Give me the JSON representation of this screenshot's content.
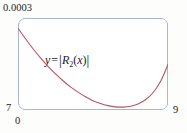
{
  "figure": {
    "background_color": "#fdfdfb",
    "frame_color": "#a9b6d4",
    "curve_color": "#b35663"
  },
  "axes": {
    "y_max_label": "0.0003",
    "y_min_label": "7",
    "x_min_label": "0",
    "x_max_label": "9"
  },
  "annotation": {
    "y_var": "y",
    "equals": "=",
    "bar_open": "|",
    "remainder_symbol": "R",
    "subscript": "2",
    "paren_open": "(",
    "argument": "x",
    "paren_close": ")",
    "bar_close": "|",
    "full_text": "y = |R2(x)|"
  },
  "chart_data": {
    "type": "line",
    "title": "",
    "xlabel": "",
    "ylabel": "",
    "xlim": [
      7,
      9
    ],
    "ylim": [
      0,
      0.0003
    ],
    "xtick_labels": [
      "7",
      "9"
    ],
    "ytick_labels": [
      "0",
      "0.0003"
    ],
    "grid": false,
    "legend": null,
    "annotations": [
      {
        "text": "y = |R2(x)|",
        "x": 7.35,
        "y": 0.000175
      }
    ],
    "series": [
      {
        "name": "|R2(x)|",
        "color": "#b35663",
        "x": [
          7.0,
          7.1,
          7.2,
          7.3,
          7.4,
          7.5,
          7.6,
          7.7,
          7.8,
          7.9,
          8.0,
          8.1,
          8.2,
          8.3,
          8.4,
          8.5,
          8.6,
          8.7,
          8.8,
          8.9,
          9.0
        ],
        "y": [
          0.000272,
          0.000236,
          0.000202,
          0.000171,
          0.000142,
          0.000116,
          9.3e-05,
          7.2e-05,
          5.4e-05,
          3.8e-05,
          2.5e-05,
          1.5e-05,
          8e-06,
          4e-06,
          3e-06,
          6e-06,
          1.4e-05,
          2.8e-05,
          5.2e-05,
          9e-05,
          0.000148
        ]
      }
    ]
  }
}
